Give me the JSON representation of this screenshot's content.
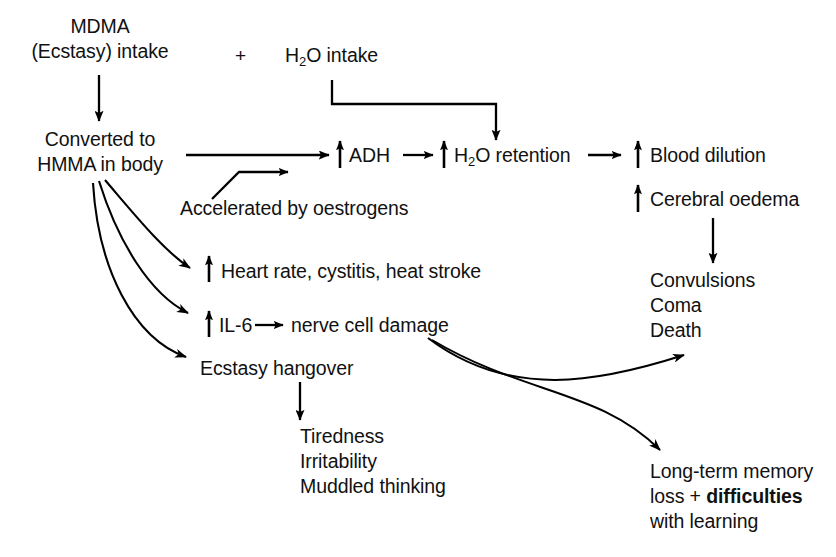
{
  "diagram": {
    "type": "flowchart",
    "background_color": "#ffffff",
    "line_color": "#000000",
    "nodes": {
      "mdma_line1": "MDMA",
      "mdma_line2": "(Ecstasy) intake",
      "plus": "+",
      "h2o_intake_pre": "H",
      "h2o_intake_sub": "2",
      "h2o_intake_post": "O intake",
      "converted_line1": "Converted to",
      "converted_line2": "HMMA in body",
      "adh": "ADH",
      "h2o_retention_pre": "H",
      "h2o_retention_sub": "2",
      "h2o_retention_post": "O retention",
      "blood_dilution": "Blood dilution",
      "cerebral_oedema": "Cerebral oedema",
      "accelerated": "Accelerated by oestrogens",
      "heart_rate": "Heart rate, cystitis, heat stroke",
      "il6": "IL-6",
      "nerve_cell_damage": "nerve cell damage",
      "ecstasy_hangover": "Ecstasy hangover",
      "convulsions": "Convulsions",
      "coma": "Coma",
      "death": "Death",
      "tiredness": "Tiredness",
      "irritability": "Irritability",
      "muddled_thinking": "Muddled thinking",
      "memory_line1": "Long-term memory",
      "memory_line2_a": "loss + ",
      "memory_line2_b": "difficulties",
      "memory_line3": "with learning"
    }
  }
}
